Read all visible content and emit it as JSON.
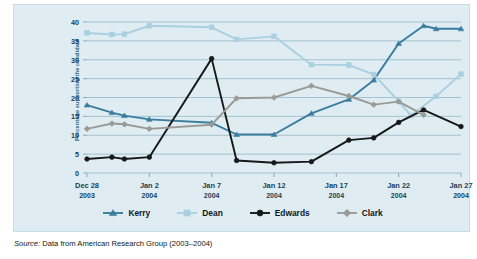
{
  "figure": {
    "background_color": "#dfecf2",
    "source_prefix": "Source:",
    "source_text": "Data from American Research Group (2003–2004)"
  },
  "chart_data": {
    "type": "line",
    "title": "",
    "xlabel": "",
    "ylabel": "Percentage supporting the candidate",
    "ylim": [
      0,
      40
    ],
    "ytick_values": [
      0,
      5,
      10,
      15,
      20,
      25,
      30,
      35,
      40
    ],
    "grid": true,
    "legend_position": "bottom",
    "x": [
      "Dec 28 2003",
      "Dec 29 2003",
      "Dec 30 2003",
      "Dec 31 2003",
      "Jan 1 2004",
      "Jan 2 2004",
      "Jan 3 2004",
      "Jan 4 2004",
      "Jan 5 2004",
      "Jan 6 2004",
      "Jan 7 2004",
      "Jan 8 2004",
      "Jan 9 2004",
      "Jan 10 2004",
      "Jan 11 2004",
      "Jan 12 2004",
      "Jan 13 2004",
      "Jan 14 2004",
      "Jan 15 2004",
      "Jan 16 2004",
      "Jan 17 2004",
      "Jan 18 2004",
      "Jan 19 2004",
      "Jan 20 2004",
      "Jan 21 2004",
      "Jan 22 2004",
      "Jan 23 2004",
      "Jan 24 2004",
      "Jan 25 2004",
      "Jan 26 2004",
      "Jan 27 2004"
    ],
    "x_tick_labels": [
      {
        "date": "Dec 28",
        "year": "2003",
        "index": 0
      },
      {
        "date": "Jan 2",
        "year": "2004",
        "index": 5
      },
      {
        "date": "Jan 7",
        "year": "2004",
        "index": 10
      },
      {
        "date": "Jan 12",
        "year": "2004",
        "index": 15
      },
      {
        "date": "Jan 17",
        "year": "2004",
        "index": 20
      },
      {
        "date": "Jan 22",
        "year": "2004",
        "index": 25
      },
      {
        "date": "Jan 27",
        "year": "2004",
        "index": 30
      }
    ],
    "series": [
      {
        "name": "Kerry",
        "color": "#3b7d9e",
        "marker": "triangle",
        "points": [
          {
            "x": 0,
            "y": 18.0
          },
          {
            "x": 2,
            "y": 16.0
          },
          {
            "x": 3,
            "y": 15.2
          },
          {
            "x": 5,
            "y": 14.2
          },
          {
            "x": 10,
            "y": 13.3
          },
          {
            "x": 12,
            "y": 10.2
          },
          {
            "x": 15,
            "y": 10.2
          },
          {
            "x": 18,
            "y": 15.8
          },
          {
            "x": 21,
            "y": 19.5
          },
          {
            "x": 23,
            "y": 24.6
          },
          {
            "x": 25,
            "y": 34.3
          },
          {
            "x": 27,
            "y": 39.0
          },
          {
            "x": 28,
            "y": 38.2
          },
          {
            "x": 30,
            "y": 38.2
          }
        ]
      },
      {
        "name": "Dean",
        "color": "#a9d0e0",
        "marker": "square",
        "points": [
          {
            "x": 0,
            "y": 37.1
          },
          {
            "x": 2,
            "y": 36.7
          },
          {
            "x": 3,
            "y": 36.8
          },
          {
            "x": 5,
            "y": 39.0
          },
          {
            "x": 10,
            "y": 38.6
          },
          {
            "x": 12,
            "y": 35.4
          },
          {
            "x": 15,
            "y": 36.2
          },
          {
            "x": 18,
            "y": 28.7
          },
          {
            "x": 21,
            "y": 28.6
          },
          {
            "x": 23,
            "y": 26.1
          },
          {
            "x": 25,
            "y": 19.0
          },
          {
            "x": 26,
            "y": 15.2
          },
          {
            "x": 28,
            "y": 20.3
          },
          {
            "x": 30,
            "y": 26.2
          }
        ]
      },
      {
        "name": "Edwards",
        "color": "#17181a",
        "marker": "circle",
        "points": [
          {
            "x": 0,
            "y": 3.7
          },
          {
            "x": 2,
            "y": 4.2
          },
          {
            "x": 3,
            "y": 3.7
          },
          {
            "x": 5,
            "y": 4.2
          },
          {
            "x": 10,
            "y": 30.3
          },
          {
            "x": 12,
            "y": 3.3
          },
          {
            "x": 15,
            "y": 2.7
          },
          {
            "x": 18,
            "y": 3.0
          },
          {
            "x": 21,
            "y": 8.7
          },
          {
            "x": 23,
            "y": 9.3
          },
          {
            "x": 25,
            "y": 13.4
          },
          {
            "x": 27,
            "y": 16.7
          },
          {
            "x": 30,
            "y": 12.3
          }
        ]
      },
      {
        "name": "Clark",
        "color": "#9a9a96",
        "marker": "diamond",
        "points": [
          {
            "x": 0,
            "y": 11.7
          },
          {
            "x": 2,
            "y": 13.1
          },
          {
            "x": 3,
            "y": 12.9
          },
          {
            "x": 5,
            "y": 11.7
          },
          {
            "x": 10,
            "y": 12.8
          },
          {
            "x": 12,
            "y": 19.8
          },
          {
            "x": 15,
            "y": 20.0
          },
          {
            "x": 18,
            "y": 23.1
          },
          {
            "x": 21,
            "y": 20.4
          },
          {
            "x": 23,
            "y": 18.1
          },
          {
            "x": 25,
            "y": 18.9
          },
          {
            "x": 27,
            "y": 15.4
          }
        ]
      }
    ],
    "legend": [
      {
        "label": "Kerry",
        "color": "#3b7d9e",
        "marker": "triangle"
      },
      {
        "label": "Dean",
        "color": "#a9d0e0",
        "marker": "square"
      },
      {
        "label": "Edwards",
        "color": "#17181a",
        "marker": "circle"
      },
      {
        "label": "Clark",
        "color": "#9a9a96",
        "marker": "diamond"
      }
    ]
  }
}
